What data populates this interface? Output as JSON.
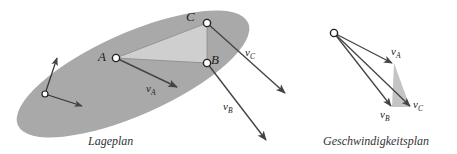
{
  "colors": {
    "body_fill": "#a9a9a9",
    "triangle_fill": "#cfcfcf",
    "arrow": "#444444",
    "point_stroke": "#222222",
    "text": "#222222"
  },
  "lageplan": {
    "caption": "Lageplan",
    "points": [
      {
        "id": "A",
        "label": "A",
        "x": 116,
        "y": 58
      },
      {
        "id": "B",
        "label": "B",
        "x": 207,
        "y": 63
      },
      {
        "id": "C",
        "label": "C",
        "x": 207,
        "y": 23
      }
    ],
    "velocities": [
      {
        "from": "A",
        "label": "v",
        "sub": "A",
        "tip": [
          176,
          87
        ]
      },
      {
        "from": "B",
        "label": "v",
        "sub": "B",
        "tip": [
          266,
          140
        ]
      },
      {
        "from": "C",
        "label": "v",
        "sub": "C",
        "tip": [
          285,
          93
        ]
      }
    ],
    "frame_origin": {
      "x": 45,
      "y": 94
    }
  },
  "geschwindigkeitsplan": {
    "caption": "Geschwindigkeitsplan",
    "pole": {
      "x": 334,
      "y": 33
    },
    "vectors": [
      {
        "label": "v",
        "sub": "A",
        "tip": [
          392,
          63
        ]
      },
      {
        "label": "v",
        "sub": "B",
        "tip": [
          392,
          106
        ]
      },
      {
        "label": "v",
        "sub": "C",
        "tip": [
          410,
          107
        ]
      }
    ]
  }
}
